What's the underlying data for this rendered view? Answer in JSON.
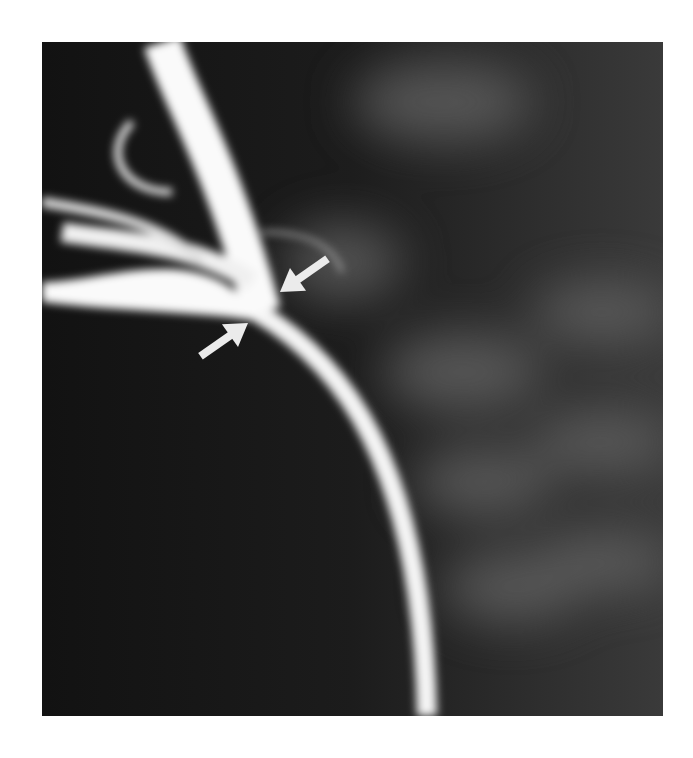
{
  "image": {
    "type": "radiograph",
    "description": "Contrast venogram showing a focal stenosis with two white arrows pointing at the narrowed segment",
    "annotations": [
      {
        "type": "arrow",
        "direction": "down-left",
        "label": ""
      },
      {
        "type": "arrow",
        "direction": "up-right",
        "label": ""
      }
    ],
    "colors": {
      "background": "#1a1a1a",
      "contrast": "#ffffff",
      "arrow": "#e8e8e8"
    }
  }
}
